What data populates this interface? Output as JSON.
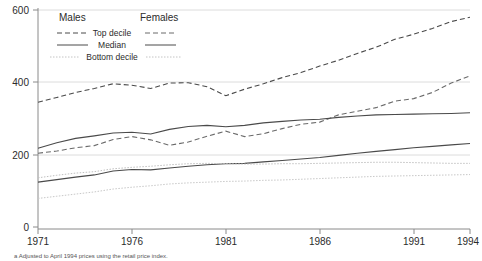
{
  "chart_data": {
    "type": "line",
    "title": "",
    "xlabel": "",
    "ylabel": "",
    "xlim": [
      1971,
      1994
    ],
    "ylim": [
      0,
      600
    ],
    "yticks": [
      0,
      200,
      400,
      600
    ],
    "xticks": [
      1971,
      1976,
      1981,
      1986,
      1991,
      1994
    ],
    "grid": true,
    "legend_position": "top-left-inside",
    "legend": {
      "col_headers": [
        "Males",
        "Females"
      ],
      "row_labels": [
        "Top decile",
        "Median",
        "Bottom decile"
      ]
    },
    "footnote": "a  Adjusted to April 1994 prices using the retail price index.",
    "x": [
      1971,
      1972,
      1973,
      1974,
      1975,
      1976,
      1977,
      1978,
      1979,
      1980,
      1981,
      1982,
      1983,
      1984,
      1985,
      1986,
      1987,
      1988,
      1989,
      1990,
      1991,
      1992,
      1993,
      1994
    ],
    "series": [
      {
        "name": "Males Top decile",
        "style": "dashed",
        "color": "#4a4a4a",
        "values": [
          345,
          358,
          372,
          383,
          396,
          392,
          383,
          398,
          399,
          388,
          363,
          381,
          396,
          413,
          427,
          445,
          461,
          480,
          497,
          519,
          533,
          549,
          568,
          580
        ]
      },
      {
        "name": "Females Top decile",
        "style": "dashed",
        "color": "#6a6a6a",
        "values": [
          204,
          210,
          219,
          225,
          242,
          250,
          241,
          226,
          235,
          251,
          265,
          250,
          258,
          272,
          284,
          290,
          310,
          320,
          330,
          348,
          355,
          372,
          398,
          418
        ]
      },
      {
        "name": "Males Median",
        "style": "solid",
        "color": "#4a4a4a",
        "values": [
          218,
          233,
          245,
          252,
          260,
          262,
          257,
          270,
          278,
          281,
          277,
          281,
          288,
          292,
          296,
          298,
          303,
          307,
          310,
          311,
          312,
          313,
          314,
          316
        ]
      },
      {
        "name": "Females Median",
        "style": "solid",
        "color": "#4a4a4a",
        "values": [
          124,
          131,
          138,
          144,
          155,
          159,
          158,
          163,
          168,
          172,
          175,
          176,
          180,
          184,
          188,
          192,
          198,
          204,
          209,
          214,
          219,
          223,
          227,
          231
        ]
      },
      {
        "name": "Males Bottom decile",
        "style": "dotted",
        "color": "#c0c0c0",
        "values": [
          136,
          143,
          149,
          153,
          161,
          165,
          168,
          172,
          175,
          176,
          175,
          174,
          174,
          175,
          175,
          176,
          177,
          178,
          179,
          179,
          178,
          177,
          176,
          176
        ]
      },
      {
        "name": "Females Bottom decile",
        "style": "dotted",
        "color": "#c8c8c8",
        "values": [
          79,
          85,
          91,
          97,
          105,
          110,
          114,
          119,
          122,
          124,
          126,
          127,
          129,
          130,
          132,
          134,
          136,
          138,
          140,
          141,
          142,
          143,
          144,
          145
        ]
      }
    ]
  },
  "axis": {
    "y_tick_labels": [
      "600",
      "400",
      "200",
      "0"
    ],
    "x_tick_labels": [
      "1971",
      "1976",
      "1981",
      "1986",
      "1991",
      "1994"
    ]
  },
  "legend": {
    "males_header": "Males",
    "females_header": "Females",
    "row_top_decile": "Top decile",
    "row_median": "Median",
    "row_bottom_decile": "Bottom decile"
  },
  "footnote": {
    "text": "a  Adjusted to April 1994 prices using the retail price index."
  },
  "colors": {
    "axis": "#8a8a8a",
    "grid": "#dcdcdc",
    "dark_line": "#4a4a4a",
    "light_line": "#c4c4c4",
    "text": "#2b2b2b"
  }
}
